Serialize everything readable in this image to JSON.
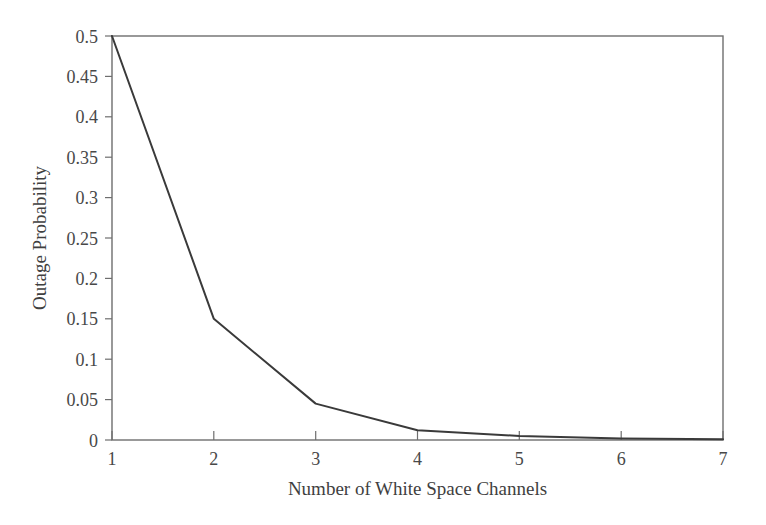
{
  "chart_data": {
    "type": "line",
    "title": "",
    "xlabel": "Number of White Space Channels",
    "ylabel": "Outage Probability",
    "x": [
      1,
      2,
      3,
      4,
      5,
      6,
      7
    ],
    "values": [
      0.5,
      0.15,
      0.045,
      0.012,
      0.005,
      0.002,
      0.001
    ],
    "series": [
      {
        "name": "Outage Probability",
        "values": [
          0.5,
          0.15,
          0.045,
          0.012,
          0.005,
          0.002,
          0.001
        ]
      }
    ],
    "xlim": [
      1,
      7
    ],
    "ylim": [
      0,
      0.5
    ],
    "xticks": [
      1,
      2,
      3,
      4,
      5,
      6,
      7
    ],
    "xtick_labels": [
      "1",
      "2",
      "3",
      "4",
      "5",
      "6",
      "7"
    ],
    "yticks": [
      0,
      0.05,
      0.1,
      0.15,
      0.2,
      0.25,
      0.3,
      0.35,
      0.4,
      0.45,
      0.5
    ],
    "ytick_labels": [
      "0",
      "0.05",
      "0.1",
      "0.15",
      "0.2",
      "0.25",
      "0.3",
      "0.35",
      "0.4",
      "0.45",
      "0.5"
    ],
    "grid": false,
    "legend": false,
    "legend_position": "none",
    "line_color": "#3a3a3a",
    "axis_color": "#6e6e6e",
    "background_color": "#ffffff"
  }
}
